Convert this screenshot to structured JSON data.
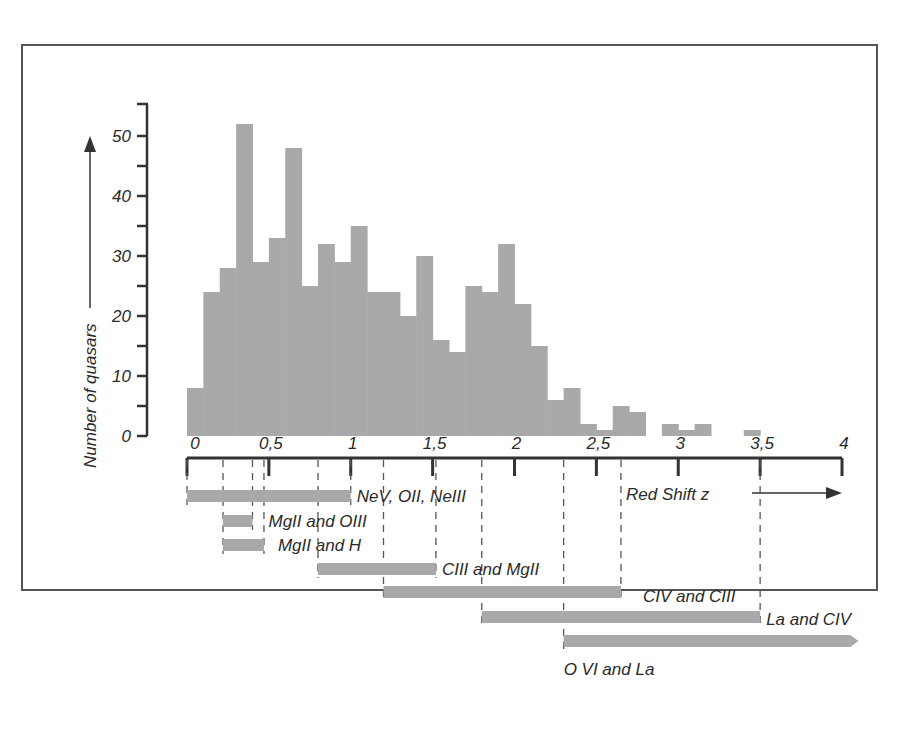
{
  "chart_data": {
    "type": "bar",
    "title": "",
    "xlabel": "Red Shift z",
    "ylabel": "Number of quasars",
    "ylim": [
      0,
      55
    ],
    "xlim": [
      0,
      4
    ],
    "y_ticks": [
      "0",
      "10",
      "20",
      "30",
      "40",
      "50"
    ],
    "x_ticks": [
      "0",
      "0,5",
      "1",
      "1,5",
      "2",
      "2,5",
      "3",
      "3,5",
      "4"
    ],
    "bin_width": 0.1,
    "bins": [
      {
        "z0": 0.0,
        "z1": 0.1,
        "count": 8
      },
      {
        "z0": 0.1,
        "z1": 0.2,
        "count": 24
      },
      {
        "z0": 0.2,
        "z1": 0.3,
        "count": 28
      },
      {
        "z0": 0.3,
        "z1": 0.4,
        "count": 52
      },
      {
        "z0": 0.4,
        "z1": 0.5,
        "count": 29
      },
      {
        "z0": 0.5,
        "z1": 0.6,
        "count": 33
      },
      {
        "z0": 0.6,
        "z1": 0.7,
        "count": 48
      },
      {
        "z0": 0.7,
        "z1": 0.8,
        "count": 25
      },
      {
        "z0": 0.8,
        "z1": 0.9,
        "count": 32
      },
      {
        "z0": 0.9,
        "z1": 1.0,
        "count": 29
      },
      {
        "z0": 1.0,
        "z1": 1.1,
        "count": 35
      },
      {
        "z0": 1.1,
        "z1": 1.2,
        "count": 24
      },
      {
        "z0": 1.2,
        "z1": 1.3,
        "count": 24
      },
      {
        "z0": 1.3,
        "z1": 1.4,
        "count": 20
      },
      {
        "z0": 1.4,
        "z1": 1.5,
        "count": 30
      },
      {
        "z0": 1.5,
        "z1": 1.6,
        "count": 16
      },
      {
        "z0": 1.6,
        "z1": 1.7,
        "count": 14
      },
      {
        "z0": 1.7,
        "z1": 1.8,
        "count": 25
      },
      {
        "z0": 1.8,
        "z1": 1.9,
        "count": 24
      },
      {
        "z0": 1.9,
        "z1": 2.0,
        "count": 32
      },
      {
        "z0": 2.0,
        "z1": 2.1,
        "count": 22
      },
      {
        "z0": 2.1,
        "z1": 2.2,
        "count": 15
      },
      {
        "z0": 2.2,
        "z1": 2.3,
        "count": 6
      },
      {
        "z0": 2.3,
        "z1": 2.4,
        "count": 8
      },
      {
        "z0": 2.4,
        "z1": 2.5,
        "count": 2
      },
      {
        "z0": 2.5,
        "z1": 2.6,
        "count": 1
      },
      {
        "z0": 2.6,
        "z1": 2.7,
        "count": 5
      },
      {
        "z0": 2.7,
        "z1": 2.8,
        "count": 4
      },
      {
        "z0": 2.9,
        "z1": 3.0,
        "count": 2
      },
      {
        "z0": 3.0,
        "z1": 3.1,
        "count": 1
      },
      {
        "z0": 3.1,
        "z1": 3.2,
        "count": 2
      },
      {
        "z0": 3.4,
        "z1": 3.5,
        "count": 1
      }
    ],
    "line_pair_ranges": [
      {
        "label": "NeV, OII, NeIII",
        "z_start": 0.0,
        "z_end": 1.0
      },
      {
        "label": "MgII and OIII",
        "z_start": 0.22,
        "z_end": 0.4
      },
      {
        "label": "MgII and H",
        "z_start": 0.22,
        "z_end": 0.47
      },
      {
        "label": "CIII and MgII",
        "z_start": 0.8,
        "z_end": 1.52
      },
      {
        "label": "CIV and CIII",
        "z_start": 1.2,
        "z_end": 2.65
      },
      {
        "label": "La and CIV",
        "z_start": 1.8,
        "z_end": 3.5
      },
      {
        "label": "O VI and La",
        "z_start": 2.3,
        "z_end": 4.1
      }
    ],
    "dashed_guides_z": [
      0.0,
      0.22,
      0.4,
      0.47,
      0.8,
      1.0,
      1.2,
      1.52,
      1.8,
      2.3,
      2.65,
      3.5
    ],
    "bar_color": "#a9a9a9",
    "axis_color": "#333333",
    "legend": null,
    "grid": false
  }
}
